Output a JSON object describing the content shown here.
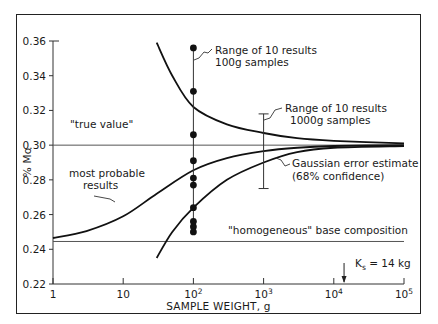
{
  "chart_data": {
    "type": "line",
    "title": "",
    "xlabel": "SAMPLE WEIGHT, g",
    "ylabel": "% Mo",
    "xscale": "log",
    "xlim": [
      1,
      100000
    ],
    "ylim": [
      0.22,
      0.36
    ],
    "grid": false,
    "x_ticks": [
      {
        "value": 1,
        "label": "1"
      },
      {
        "value": 10,
        "label": "10"
      },
      {
        "value": 100,
        "label": "10",
        "sup": "2"
      },
      {
        "value": 1000,
        "label": "10",
        "sup": "3"
      },
      {
        "value": 10000,
        "label": "10",
        "sup": "4"
      },
      {
        "value": 100000,
        "label": "10",
        "sup": "5"
      }
    ],
    "y_ticks": [
      {
        "value": 0.22,
        "label": "0.22"
      },
      {
        "value": 0.24,
        "label": "0.24"
      },
      {
        "value": 0.26,
        "label": "0.26"
      },
      {
        "value": 0.28,
        "label": "0.28"
      },
      {
        "value": 0.3,
        "label": "0.30"
      },
      {
        "value": 0.32,
        "label": "0.32"
      },
      {
        "value": 0.34,
        "label": "0.34"
      },
      {
        "value": 0.36,
        "label": "0.36"
      }
    ],
    "reference_lines": [
      {
        "name": "true-value",
        "y": 0.3,
        "label": "\"true value\""
      },
      {
        "name": "base-composition",
        "y": 0.2445,
        "label": "\"homogeneous\" base composition"
      }
    ],
    "series": [
      {
        "name": "most probable results",
        "x": [
          1,
          3,
          10,
          30,
          100,
          300,
          1000,
          3000,
          10000,
          100000
        ],
        "y": [
          0.2465,
          0.2505,
          0.259,
          0.272,
          0.2855,
          0.2925,
          0.2965,
          0.2985,
          0.2995,
          0.3
        ]
      },
      {
        "name": "Gaussian error estimate upper",
        "x": [
          30,
          50,
          100,
          300,
          1000,
          3000,
          10000,
          100000
        ],
        "y": [
          0.359,
          0.34,
          0.322,
          0.312,
          0.307,
          0.304,
          0.3025,
          0.301
        ]
      },
      {
        "name": "Gaussian error estimate lower",
        "x": [
          30,
          50,
          100,
          300,
          1000,
          3000,
          10000,
          100000
        ],
        "y": [
          0.235,
          0.25,
          0.264,
          0.28,
          0.29,
          0.296,
          0.2985,
          0.2995
        ]
      }
    ],
    "points_100g": {
      "x": 100,
      "y": [
        0.356,
        0.331,
        0.306,
        0.291,
        0.281,
        0.277,
        0.264,
        0.256,
        0.253,
        0.25
      ]
    },
    "range_bars": [
      {
        "name": "100g samples",
        "x": 100,
        "ymin": 0.25,
        "ymax": 0.356
      },
      {
        "name": "1000g samples",
        "x": 1000,
        "ymin": 0.275,
        "ymax": 0.318
      }
    ],
    "annotations": {
      "range_100": [
        "Range of 10 results",
        "100g samples"
      ],
      "range_1000": [
        "Range of 10 results",
        "1000g samples"
      ],
      "most_probable": [
        "most probable",
        "results"
      ],
      "gaussian": [
        "Gaussian error estimate",
        "(68% confidence)"
      ],
      "true_value": "\"true value\"",
      "base": "\"homogeneous\" base composition",
      "ks": "K",
      "ks_sub": "s",
      "ks_value": " = 14 kg",
      "ks_x": 14000
    }
  }
}
